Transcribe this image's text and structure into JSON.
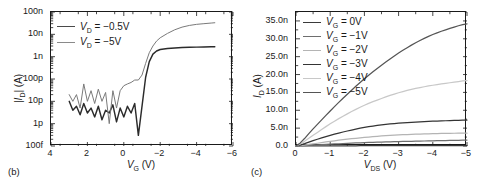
{
  "figure": {
    "panels": [
      {
        "tag": "(b)",
        "name": "transfer-characteristics",
        "chart_data": {
          "type": "line",
          "title": "",
          "xlabel": "V_G (V)",
          "ylabel": "|I_D| (A)",
          "xlim": [
            4,
            -6
          ],
          "ylim_log": [
            1e-13,
            1e-07
          ],
          "yscale": "log",
          "xticks": [
            4,
            2,
            0,
            -2,
            -4,
            -6
          ],
          "xticklabels": [
            "4",
            "2",
            "0",
            "-2",
            "-4",
            "-6"
          ],
          "yticks": [
            1e-13,
            1e-12,
            1e-11,
            1e-10,
            1e-09,
            1e-08,
            1e-07
          ],
          "yticklabels": [
            "100f",
            "1p",
            "10p",
            "100p",
            "1n",
            "10n",
            "100n"
          ],
          "grid": false,
          "legend_position": "upper left",
          "series": [
            {
              "name": "V_D = -0.5V",
              "color": "#2b2b2b",
              "x": [
                3.0,
                2.8,
                2.6,
                2.4,
                2.2,
                2.0,
                1.8,
                1.6,
                1.4,
                1.2,
                1.0,
                0.8,
                0.6,
                0.4,
                0.2,
                0.0,
                -0.2,
                -0.4,
                -0.6,
                -0.8,
                -1.0,
                -1.2,
                -1.4,
                -1.6,
                -1.8,
                -2.0,
                -2.4,
                -2.8,
                -3.2,
                -3.6,
                -4.0,
                -4.4,
                -4.8,
                -5.0
              ],
              "y": [
                1e-11,
                4e-12,
                6e-12,
                2.5e-12,
                8e-12,
                3e-12,
                5e-12,
                2e-12,
                6e-12,
                1.5e-12,
                4e-12,
                3e-12,
                7e-12,
                1.2e-12,
                5e-12,
                2e-12,
                6e-12,
                3e-12,
                8e-12,
                3e-13,
                6e-12,
                1.2e-10,
                6e-10,
                1.3e-09,
                1.8e-09,
                2.1e-09,
                2.3e-09,
                2.45e-09,
                2.55e-09,
                2.62e-09,
                2.68e-09,
                2.72e-09,
                2.76e-09,
                2.8e-09
              ]
            },
            {
              "name": "V_D = -5V",
              "color": "#7a7a7a",
              "x": [
                3.0,
                2.8,
                2.6,
                2.4,
                2.2,
                2.0,
                1.8,
                1.6,
                1.4,
                1.2,
                1.0,
                0.8,
                0.6,
                0.4,
                0.2,
                0.0,
                -0.2,
                -0.4,
                -0.6,
                -0.8,
                -1.0,
                -1.2,
                -1.4,
                -1.6,
                -1.8,
                -2.0,
                -2.4,
                -2.8,
                -3.2,
                -3.6,
                -4.0,
                -4.4,
                -4.8,
                -5.0
              ],
              "y": [
                2e-11,
                1e-11,
                2e-11,
                5e-12,
                6e-11,
                1e-11,
                3e-11,
                8e-12,
                3.5e-11,
                1e-11,
                2.5e-11,
                1e-12,
                3e-11,
                5e-12,
                3e-11,
                5e-11,
                6e-11,
                7e-11,
                9e-11,
                9e-11,
                1.5e-10,
                5e-10,
                1.5e-09,
                3e-09,
                5e-09,
                7e-09,
                1.1e-08,
                1.6e-08,
                2.1e-08,
                2.5e-08,
                2.8e-08,
                3e-08,
                3.2e-08,
                3.3e-08
              ]
            }
          ],
          "legend": [
            "V_D = -0.5V",
            "V_D = -5V"
          ]
        },
        "legend_items": [
          {
            "label_pre": "V",
            "label_sub": "D",
            "label_post": " = −0.5V",
            "color": "#4a4a4a"
          },
          {
            "label_pre": "V",
            "label_sub": "D",
            "label_post": " = −5V",
            "color": "#8a8a8a"
          }
        ],
        "ytick_labels": [
          "100n",
          "10n",
          "1n",
          "100p",
          "10p",
          "1p",
          "100f"
        ],
        "xtick_labels": [
          "4",
          "2",
          "0",
          "−2",
          "−4",
          "−6"
        ],
        "xaxis_title_pre": "V",
        "xaxis_title_sub": "G",
        "xaxis_title_unit": " (V)",
        "yaxis_title_pre": "|I",
        "yaxis_title_sub": "D",
        "yaxis_title_unit": "| (A)"
      },
      {
        "tag": "(c)",
        "name": "output-characteristics",
        "chart_data": {
          "type": "line",
          "title": "",
          "xlabel": "V_DS (V)",
          "ylabel": "I_D (A)",
          "xlim": [
            0,
            -5
          ],
          "ylim": [
            0,
            3.75e-08
          ],
          "yscale": "linear",
          "xticks": [
            0,
            -1,
            -2,
            -3,
            -4,
            -5
          ],
          "xticklabels": [
            "0",
            "-1",
            "-2",
            "-3",
            "-4",
            "-5"
          ],
          "yticks": [
            0,
            5e-09,
            1e-08,
            1.5e-08,
            2e-08,
            2.5e-08,
            3e-08,
            3.5e-08
          ],
          "yticklabels": [
            "0.0",
            "5.0n",
            "10.0n",
            "15.0n",
            "20.0n",
            "25.0n",
            "30.0n",
            "35.0n"
          ],
          "grid": false,
          "legend_position": "upper left",
          "series": [
            {
              "name": "V_G = 0V",
              "color": "#3a3a3a",
              "x": [
                0,
                -0.5,
                -1,
                -1.5,
                -2,
                -2.5,
                -3,
                -3.5,
                -4,
                -4.5,
                -5
              ],
              "y": [
                0,
                2e-11,
                4e-11,
                6e-11,
                8e-11,
                9e-11,
                1e-10,
                1.1e-10,
                1.2e-10,
                1.3e-10,
                1.4e-10
              ]
            },
            {
              "name": "V_G = -1V",
              "color": "#6e6e6e",
              "x": [
                0,
                -0.5,
                -1,
                -1.5,
                -2,
                -2.5,
                -3,
                -3.5,
                -4,
                -4.5,
                -5
              ],
              "y": [
                0,
                2.5e-10,
                5e-10,
                7.5e-10,
                9.5e-10,
                1.1e-09,
                1.25e-09,
                1.35e-09,
                1.45e-09,
                1.55e-09,
                1.65e-09
              ]
            },
            {
              "name": "V_G = -2V",
              "color": "#b4b4b4",
              "x": [
                0,
                -0.5,
                -1,
                -1.5,
                -2,
                -2.5,
                -3,
                -3.5,
                -4,
                -4.5,
                -5
              ],
              "y": [
                0,
                6e-10,
                1.3e-09,
                1.9e-09,
                2.4e-09,
                2.8e-09,
                3.1e-09,
                3.3e-09,
                3.45e-09,
                3.55e-09,
                3.6e-09
              ]
            },
            {
              "name": "V_G = -3V",
              "color": "#343434",
              "x": [
                0,
                -0.5,
                -1,
                -1.5,
                -2,
                -2.5,
                -3,
                -3.5,
                -4,
                -4.5,
                -5
              ],
              "y": [
                0,
                1.5e-09,
                3e-09,
                4.2e-09,
                5.2e-09,
                5.9e-09,
                6.4e-09,
                6.7e-09,
                6.95e-09,
                7.1e-09,
                7.25e-09
              ]
            },
            {
              "name": "V_G = -4V",
              "color": "#c8c8c8",
              "x": [
                0,
                -0.5,
                -1,
                -1.5,
                -2,
                -2.5,
                -3,
                -3.5,
                -4,
                -4.5,
                -5
              ],
              "y": [
                0,
                3e-09,
                6.2e-09,
                9e-09,
                1.14e-08,
                1.33e-08,
                1.49e-08,
                1.61e-08,
                1.7e-08,
                1.77e-08,
                1.83e-08
              ]
            },
            {
              "name": "V_G = -5V",
              "color": "#555555",
              "x": [
                0,
                -0.5,
                -1,
                -1.5,
                -2,
                -2.5,
                -3,
                -3.5,
                -4,
                -4.5,
                -5
              ],
              "y": [
                0,
                4.8e-09,
                9.8e-09,
                1.45e-08,
                1.88e-08,
                2.26e-08,
                2.6e-08,
                2.89e-08,
                3.12e-08,
                3.29e-08,
                3.42e-08
              ]
            }
          ],
          "legend": [
            "V_G = 0V",
            "V_G = -1V",
            "V_G = -2V",
            "V_G = -3V",
            "V_G = -4V",
            "V_G = -5V"
          ]
        },
        "legend_items": [
          {
            "label_pre": "V",
            "label_sub": "G",
            "label_post": " = 0V",
            "color": "#3a3a3a"
          },
          {
            "label_pre": "V",
            "label_sub": "G",
            "label_post": " = −1V",
            "color": "#6e6e6e"
          },
          {
            "label_pre": "V",
            "label_sub": "G",
            "label_post": " = −2V",
            "color": "#b4b4b4"
          },
          {
            "label_pre": "V",
            "label_sub": "G",
            "label_post": " = −3V",
            "color": "#343434"
          },
          {
            "label_pre": "V",
            "label_sub": "G",
            "label_post": " = −4V",
            "color": "#c8c8c8"
          },
          {
            "label_pre": "V",
            "label_sub": "G",
            "label_post": " = −5V",
            "color": "#555555"
          }
        ],
        "ytick_labels": [
          "35.0n",
          "30.0n",
          "25.0n",
          "20.0n",
          "15.0n",
          "10.0n",
          "5.0n",
          "0.0"
        ],
        "xtick_labels": [
          "0",
          "−1",
          "−2",
          "−3",
          "−4",
          "−5"
        ],
        "xaxis_title_pre": "V",
        "xaxis_title_sub": "DS",
        "xaxis_title_unit": " (V)",
        "yaxis_title_pre": "I",
        "yaxis_title_sub": "D",
        "yaxis_title_unit": " (A)"
      }
    ]
  }
}
